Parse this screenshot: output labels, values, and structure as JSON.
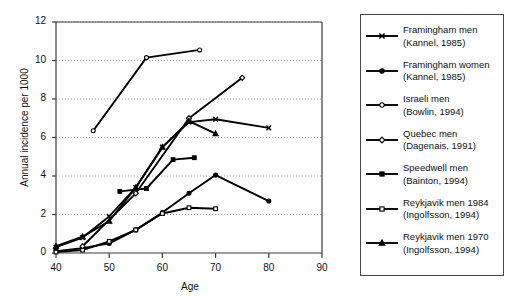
{
  "chart_data": {
    "type": "line",
    "title": "",
    "xlabel": "Age",
    "ylabel": "Annual incidence per 1000",
    "xlim": [
      40,
      90
    ],
    "ylim": [
      0,
      12
    ],
    "xticks": [
      40,
      50,
      60,
      70,
      80,
      90
    ],
    "yticks": [
      0,
      2,
      4,
      6,
      8,
      10,
      12
    ],
    "grid": "horizontal-dotted",
    "legend_position": "right-outside",
    "series": [
      {
        "name": "Framingham men",
        "source": "(Kannel, 1985)",
        "marker": "cross-x",
        "fill": "filled",
        "x": [
          40,
          45,
          50,
          55,
          60,
          65,
          70,
          80
        ],
        "y": [
          0.3,
          0.8,
          1.9,
          3.4,
          5.5,
          6.8,
          6.95,
          6.5
        ]
      },
      {
        "name": "Framingham women",
        "source": "(Kannel, 1985)",
        "marker": "circle",
        "fill": "filled",
        "x": [
          40,
          45,
          50,
          55,
          60,
          65,
          70,
          80
        ],
        "y": [
          0.1,
          0.25,
          0.5,
          1.2,
          2.1,
          3.1,
          4.05,
          2.7
        ]
      },
      {
        "name": "Israeli men",
        "source": "(Bowlin, 1994)",
        "marker": "circle",
        "fill": "open",
        "x": [
          47,
          57,
          67
        ],
        "y": [
          6.35,
          10.15,
          10.55
        ]
      },
      {
        "name": "Quebec men",
        "source": "(Dagenais, 1991)",
        "marker": "diamond",
        "fill": "open",
        "x": [
          45,
          55,
          65,
          75
        ],
        "y": [
          0.35,
          3.1,
          7.0,
          9.1
        ]
      },
      {
        "name": "Speedwell men",
        "source": "(Bainton, 1994)",
        "marker": "square",
        "fill": "filled",
        "x": [
          52,
          57,
          62,
          66
        ],
        "y": [
          3.2,
          3.35,
          4.85,
          4.95
        ]
      },
      {
        "name": "Reykjavik men 1984",
        "source": "(Ingolfsson, 1994)",
        "marker": "square",
        "fill": "open",
        "x": [
          40,
          45,
          50,
          55,
          60,
          65,
          70
        ],
        "y": [
          0.05,
          0.15,
          0.6,
          1.2,
          2.05,
          2.35,
          2.3
        ]
      },
      {
        "name": "Reykjavik men 1970",
        "source": "(Ingolfsson, 1994)",
        "marker": "triangle",
        "fill": "filled",
        "x": [
          40,
          45,
          50,
          55,
          60,
          65,
          70
        ],
        "y": [
          0.35,
          0.85,
          1.65,
          3.4,
          5.5,
          6.85,
          6.2
        ]
      }
    ]
  },
  "legend": {
    "entries": [
      {
        "label": "Framingham men",
        "source": "(Kannel, 1985)",
        "marker": "cross-x-marker"
      },
      {
        "label": "Framingham women",
        "source": "(Kannel, 1985)",
        "marker": "filled-circle-marker"
      },
      {
        "label": "Israeli men",
        "source": "(Bowlin, 1994)",
        "marker": "open-circle-marker"
      },
      {
        "label": "Quebec men",
        "source": "(Dagenais, 1991)",
        "marker": "open-diamond-marker"
      },
      {
        "label": "Speedwell men",
        "source": "(Bainton, 1994)",
        "marker": "filled-square-marker"
      },
      {
        "label": "Reykjavik men 1984",
        "source": "(Ingolfsson, 1994)",
        "marker": "open-square-marker"
      },
      {
        "label": "Reykjavik men 1970",
        "source": "(Ingolfsson, 1994)",
        "marker": "filled-triangle-marker"
      }
    ]
  },
  "colors": {
    "line": "#000000",
    "axis": "#3b3b3b",
    "grid": "#8a8a8a",
    "background": "#ffffff",
    "legend_border": "#4a4a4a"
  }
}
